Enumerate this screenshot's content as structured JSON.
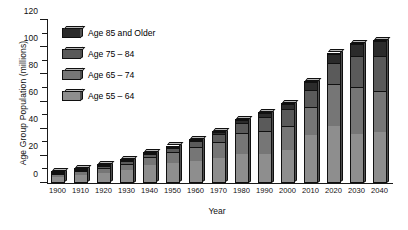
{
  "chart_data": {
    "type": "bar",
    "subtype": "stacked-bar-3d",
    "title": "",
    "xlabel": "Year",
    "ylabel": "Age Group Population (millions)",
    "ylim": [
      0,
      120
    ],
    "ytick_step": 20,
    "yminor_step": 10,
    "grid": false,
    "legend_position": "top-left-inside",
    "categories": [
      "1900",
      "1910",
      "1920",
      "1930",
      "1940",
      "1950",
      "1960",
      "1970",
      "1980",
      "1990",
      "2000",
      "2010",
      "2020",
      "2030",
      "2040"
    ],
    "ytick_labels": [
      "0",
      "20",
      "40",
      "60",
      "80",
      "100",
      "120"
    ],
    "series": [
      {
        "name": "Age 55 – 64",
        "color": "#8e8e8e",
        "values": [
          5.0,
          6.5,
          8.0,
          10.0,
          13.0,
          15.0,
          16.0,
          18.5,
          21.5,
          21.0,
          24.0,
          35.0,
          42.0,
          36.0,
          37.0
        ]
      },
      {
        "name": "Age 65 – 74",
        "color": "#767676",
        "values": [
          2.5,
          3.0,
          4.0,
          5.0,
          6.5,
          8.5,
          11.0,
          12.5,
          15.5,
          18.0,
          18.5,
          21.0,
          31.0,
          35.0,
          31.0
        ]
      },
      {
        "name": "Age 75 – 84",
        "color": "#5a5a5a",
        "values": [
          1.0,
          1.3,
          1.6,
          2.0,
          2.6,
          3.5,
          4.6,
          6.0,
          7.7,
          10.0,
          12.3,
          13.0,
          16.0,
          23.0,
          26.0
        ]
      },
      {
        "name": "Age 85 and Older",
        "color": "#2b2b2b",
        "values": [
          0.3,
          0.4,
          0.5,
          0.6,
          0.8,
          0.6,
          0.9,
          1.5,
          2.3,
          3.0,
          4.2,
          6.0,
          7.0,
          9.0,
          11.0
        ]
      }
    ],
    "totals": [
      8.8,
      11.2,
      14.1,
      17.6,
      22.9,
      27.6,
      32.5,
      38.5,
      47.0,
      52.0,
      59.0,
      75.0,
      96.0,
      103.0,
      105.0
    ]
  },
  "legend": {
    "items": [
      {
        "label": "Age 85 and Older",
        "color": "#2b2b2b"
      },
      {
        "label": "Age 75 – 84",
        "color": "#5a5a5a"
      },
      {
        "label": "Age 65 – 74",
        "color": "#767676"
      },
      {
        "label": "Age 55 – 64",
        "color": "#8e8e8e"
      }
    ]
  },
  "axes": {
    "y_title": "Age Group Population (millions)",
    "x_title": "Year"
  }
}
